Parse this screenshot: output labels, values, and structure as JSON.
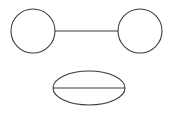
{
  "canvas": {
    "width": 175,
    "height": 114,
    "background_color": "#ffffff"
  },
  "style": {
    "stroke_color": "#3a3a3a",
    "stroke_width": 1.1,
    "fill_color": "none"
  },
  "diagram": {
    "shapes": [
      {
        "name": "left-circle",
        "type": "circle",
        "cx": 33,
        "cy": 31,
        "r": 22
      },
      {
        "name": "right-circle",
        "type": "circle",
        "cx": 140,
        "cy": 31,
        "r": 22
      },
      {
        "name": "connector-line",
        "type": "line",
        "x1": 55,
        "y1": 31,
        "x2": 118,
        "y2": 31
      },
      {
        "name": "ellipse",
        "type": "ellipse",
        "cx": 89,
        "cy": 88,
        "rx": 36,
        "ry": 17
      },
      {
        "name": "ellipse-chord-line",
        "type": "line",
        "x1": 53,
        "y1": 88,
        "x2": 125,
        "y2": 88
      }
    ]
  }
}
